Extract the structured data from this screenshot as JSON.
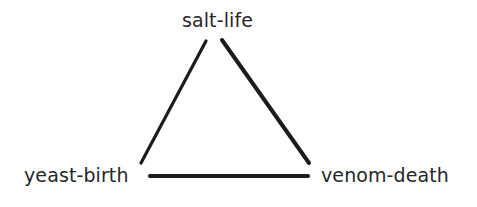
{
  "diagram": {
    "title": "",
    "background_color": "#ffffff",
    "ink_color": "#1c1c1f",
    "text_color": "#26262a",
    "shape": "triangle",
    "nodes": [
      {
        "id": "top",
        "label": "salt-life",
        "x": 220,
        "y": 21
      },
      {
        "id": "left",
        "label": "yeast-birth",
        "x": 82,
        "y": 176
      },
      {
        "id": "right",
        "label": "venom-death",
        "x": 388,
        "y": 176
      }
    ],
    "edges": [
      {
        "id": "top-left",
        "from": "top",
        "to": "left",
        "x1": 206,
        "y1": 41,
        "x2": 141,
        "y2": 163,
        "width": 3.2
      },
      {
        "id": "top-right",
        "from": "top",
        "to": "right",
        "x1": 222,
        "y1": 40,
        "x2": 309,
        "y2": 163,
        "width": 4.0
      },
      {
        "id": "left-right",
        "from": "left",
        "to": "right",
        "x1": 150,
        "y1": 176,
        "x2": 308,
        "y2": 176,
        "width": 4.2
      }
    ]
  }
}
